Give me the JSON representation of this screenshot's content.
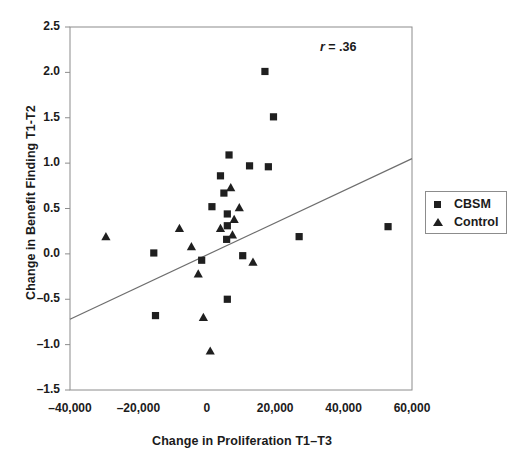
{
  "chart_data": {
    "type": "scatter",
    "title": "",
    "xlabel": "Change in Proliferation T1–T3",
    "ylabel": "Change in Benefit Finding T1-T2",
    "xlim": [
      -40000,
      60000
    ],
    "ylim": [
      -1.5,
      2.5
    ],
    "xticks": [
      -40000,
      -20000,
      0,
      20000,
      40000,
      60000
    ],
    "xtick_labels": [
      "–40,000",
      "–20,000",
      "0",
      "20,000",
      "40,000",
      "60,000"
    ],
    "yticks": [
      -1.5,
      -1.0,
      -0.5,
      0.0,
      0.5,
      1.0,
      1.5,
      2.0,
      2.5
    ],
    "ytick_labels": [
      "–1.5",
      "–1.0",
      "–0.5",
      "0.0",
      "0.5",
      "1.0",
      "1.5",
      "2.0",
      "2.5"
    ],
    "grid": false,
    "legend_position": "right",
    "annotations": [
      {
        "name": "correlation",
        "symbol": "r",
        "text": " = .36",
        "x": 46000,
        "y": 2.25
      }
    ],
    "trendline": {
      "name": "regression-line",
      "x_start": -40000,
      "y_start": -0.72,
      "x_end": 60000,
      "y_end": 1.05,
      "color": "#6e6e6e"
    },
    "series": [
      {
        "name": "CBSM",
        "marker": "square",
        "color": "#1f1f1f",
        "points": [
          [
            17000,
            2.01
          ],
          [
            19500,
            1.51
          ],
          [
            6500,
            1.09
          ],
          [
            12500,
            0.97
          ],
          [
            18000,
            0.96
          ],
          [
            4000,
            0.86
          ],
          [
            5000,
            0.67
          ],
          [
            1500,
            0.52
          ],
          [
            6000,
            0.44
          ],
          [
            6000,
            0.31
          ],
          [
            5800,
            0.16
          ],
          [
            53000,
            0.3
          ],
          [
            27000,
            0.19
          ],
          [
            -15500,
            0.01
          ],
          [
            -1500,
            -0.07
          ],
          [
            10500,
            -0.02
          ],
          [
            6000,
            -0.5
          ],
          [
            -15000,
            -0.68
          ]
        ]
      },
      {
        "name": "Control",
        "marker": "triangle",
        "color": "#1f1f1f",
        "points": [
          [
            -29500,
            0.19
          ],
          [
            -8000,
            0.28
          ],
          [
            -4500,
            0.08
          ],
          [
            7000,
            0.73
          ],
          [
            9500,
            0.51
          ],
          [
            8000,
            0.38
          ],
          [
            4000,
            0.28
          ],
          [
            7500,
            0.21
          ],
          [
            -2500,
            -0.22
          ],
          [
            13500,
            -0.09
          ],
          [
            -1000,
            -0.7
          ],
          [
            1000,
            -1.07
          ]
        ]
      }
    ]
  },
  "legend": {
    "items": [
      {
        "label": "CBSM",
        "marker": "square"
      },
      {
        "label": "Control",
        "marker": "triangle"
      }
    ]
  }
}
